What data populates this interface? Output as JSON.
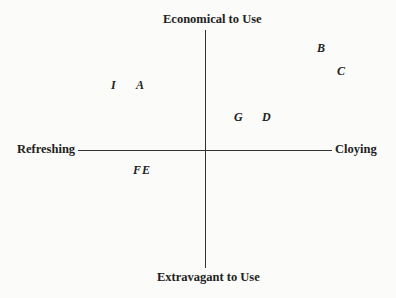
{
  "axes": {
    "top": "Economical to Use",
    "bottom": "Extravagant to Use",
    "left": "Refreshing",
    "right": "Cloying"
  },
  "points": [
    {
      "label": "I",
      "x": 113,
      "y": 79
    },
    {
      "label": "A",
      "x": 136,
      "y": 79
    },
    {
      "label": "B",
      "x": 317,
      "y": 42
    },
    {
      "label": "C",
      "x": 337,
      "y": 65
    },
    {
      "label": "G",
      "x": 234,
      "y": 111
    },
    {
      "label": "D",
      "x": 262,
      "y": 111
    },
    {
      "label": "FE",
      "x": 133,
      "y": 164
    }
  ]
}
